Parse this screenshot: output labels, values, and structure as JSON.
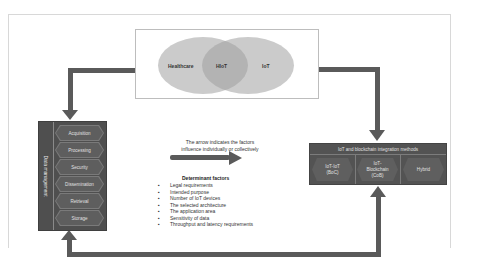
{
  "venn": {
    "left_label": "Healthcare",
    "center_label": "HIoT",
    "right_label": "IoT"
  },
  "data_management": {
    "title": "Data management",
    "steps": [
      "Acquisition",
      "Processing",
      "Security",
      "Dissemination",
      "Retrieval",
      "Storage"
    ]
  },
  "caption": {
    "line1": "The arrow indicates the factors",
    "line2": "influence individually or collectively"
  },
  "determinants": {
    "title": "Determinant factors",
    "items": [
      "Legal requirements",
      "Intended purpose",
      "Number of IoT devices",
      "The selected architecture",
      "The application area",
      "Sensitivity of data",
      "Throughput and latency requirements"
    ]
  },
  "integration": {
    "title": "IoT and blockchain integration methods",
    "methods": [
      {
        "line1": "IoT-IoT",
        "line2": "(BoC)",
        "line3": ""
      },
      {
        "line1": "IoT-",
        "line2": "Blockchain",
        "line3": "(CoB)"
      },
      {
        "line1": "Hybrid",
        "line2": "",
        "line3": ""
      }
    ]
  },
  "colors": {
    "arrow": "#5a5a5a",
    "box_fill": "#4f4f4f",
    "venn_fill": "#a0a0a0"
  }
}
